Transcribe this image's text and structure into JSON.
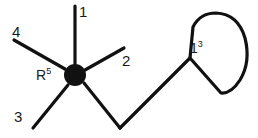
{
  "diagram": {
    "type": "chemical-structure",
    "colors": {
      "stroke": "#111111",
      "background": "#ffffff",
      "node_fill": "#111111",
      "label_color": "#1a1a1a"
    },
    "center_node": {
      "label_text": "R",
      "label_superscript": "5",
      "cx": 75,
      "cy": 75,
      "radius": 11
    },
    "substituent_labels": [
      {
        "id": "bond-label-1",
        "text": "1",
        "x": 79,
        "y": 4
      },
      {
        "id": "bond-label-2",
        "text": "2",
        "x": 122,
        "y": 53
      },
      {
        "id": "bond-label-3",
        "text": "3",
        "x": 14,
        "y": 109
      },
      {
        "id": "bond-label-4",
        "text": "4",
        "x": 12,
        "y": 24
      }
    ],
    "ring_label": {
      "text": "1",
      "superscript": "3",
      "x": 190,
      "y": 40
    },
    "bonds": [
      {
        "name": "bond-to-1",
        "x1": 75,
        "y1": 64,
        "x2": 75,
        "y2": 6
      },
      {
        "name": "bond-to-2",
        "x1": 85,
        "y1": 70,
        "x2": 124,
        "y2": 48
      },
      {
        "name": "bond-to-3",
        "x1": 68,
        "y1": 85,
        "x2": 33,
        "y2": 128
      },
      {
        "name": "bond-to-4",
        "x1": 65,
        "y1": 69,
        "x2": 14,
        "y2": 40
      },
      {
        "name": "chain-segment-1",
        "x1": 84,
        "y1": 83,
        "x2": 120,
        "y2": 128
      },
      {
        "name": "chain-segment-2",
        "x1": 120,
        "y1": 128,
        "x2": 190,
        "y2": 58
      }
    ],
    "ring": {
      "name": "cyclic-ring",
      "path": "M 190 58 L 193 27 Q 200 13 216 13 Q 238 14 245 38 Q 251 62 240 80 Q 231 94 221 93 Z",
      "attachment_vertex": {
        "x": 190,
        "y": 58
      }
    }
  }
}
